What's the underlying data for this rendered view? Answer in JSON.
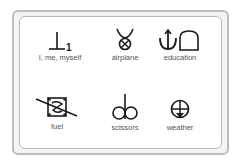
{
  "card": {
    "symbols": [
      {
        "label": "I, me, myself",
        "icon": "person-number-one-icon"
      },
      {
        "label": "airplane",
        "icon": "airplane-icon"
      },
      {
        "label": "education",
        "icon": "education-icon"
      },
      {
        "label": "fuel",
        "icon": "fuel-icon"
      },
      {
        "label": "scissors",
        "icon": "scissors-icon"
      },
      {
        "label": "weather",
        "icon": "weather-icon"
      }
    ]
  },
  "colors": {
    "ink": "#1a1a1a",
    "label": "#555555",
    "frame": "#bdbdbd"
  }
}
